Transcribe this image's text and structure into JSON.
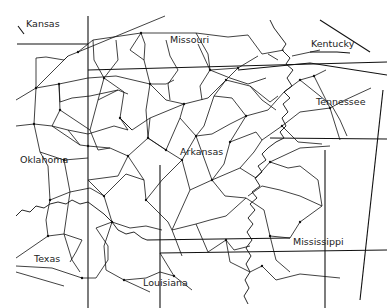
{
  "map": {
    "title": "State road network graph",
    "labels": [
      {
        "id": "kansas",
        "text": "Kansas",
        "x": 26,
        "y": 26
      },
      {
        "id": "missouri",
        "text": "Missouri",
        "x": 170,
        "y": 41
      },
      {
        "id": "kentucky",
        "text": "Kentucky",
        "x": 310,
        "y": 39
      },
      {
        "id": "tennessee",
        "text": "Tennessee",
        "x": 313,
        "y": 97
      },
      {
        "id": "oklahoma",
        "text": "Oklahoma",
        "x": 20,
        "y": 157
      },
      {
        "id": "arkansas",
        "text": "Arkansas",
        "x": 180,
        "y": 146
      },
      {
        "id": "mississippi",
        "text": "Mississippi",
        "x": 294,
        "y": 233
      },
      {
        "id": "texas",
        "text": "Texas",
        "x": 34,
        "y": 253
      },
      {
        "id": "louisiana",
        "text": "Louisiana",
        "x": 143,
        "y": 280
      }
    ],
    "colors": {
      "line": "#111111",
      "background": "#ffffff",
      "text": "#222222"
    }
  }
}
